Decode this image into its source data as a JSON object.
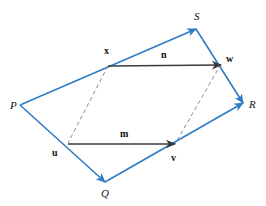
{
  "figure": {
    "width": 266,
    "height": 206,
    "background": "#ffffff",
    "colors": {
      "quadrilateral": "#2E7CC4",
      "vector_arrow": "#3A3A3A",
      "dashed_line": "#8C8C8C",
      "label_text": "#111111"
    },
    "stroke_widths": {
      "quadrilateral": 1.6,
      "vector_arrow": 1.6,
      "dashed_line": 1.0
    }
  },
  "vertices": [
    {
      "id": "P",
      "label": "P",
      "x": 20,
      "y": 105,
      "label_x": 10,
      "label_y": 100
    },
    {
      "id": "Q",
      "label": "Q",
      "x": 105,
      "y": 182,
      "label_x": 101,
      "label_y": 188
    },
    {
      "id": "R",
      "label": "R",
      "x": 243,
      "y": 103,
      "label_x": 249,
      "label_y": 99
    },
    {
      "id": "S",
      "label": "S",
      "x": 196,
      "y": 29,
      "label_x": 194,
      "label_y": 11
    }
  ],
  "points": [
    {
      "id": "u",
      "label": "u",
      "x": 68,
      "y": 143,
      "label_x": 52,
      "label_y": 148
    },
    {
      "id": "v",
      "label": "v",
      "x": 175,
      "y": 144,
      "label_x": 171,
      "label_y": 153
    },
    {
      "id": "x",
      "label": "x",
      "x": 108,
      "y": 66,
      "label_x": 104,
      "label_y": 46
    },
    {
      "id": "w",
      "label": "w",
      "x": 221,
      "y": 64,
      "label_x": 226,
      "label_y": 54
    }
  ],
  "edges": [
    {
      "id": "P-to-S",
      "from": "P",
      "to": "S",
      "arrow": "end",
      "style": "solid",
      "color": "#2E7CC4"
    },
    {
      "id": "P-to-Q",
      "from": "P",
      "to": "Q",
      "arrow": "end",
      "style": "solid",
      "color": "#2E7CC4"
    },
    {
      "id": "Q-to-R",
      "from": "Q",
      "to": "R",
      "arrow": "end",
      "style": "solid",
      "color": "#2E7CC4"
    },
    {
      "id": "S-to-R",
      "from": "S",
      "to": "R",
      "arrow": "end",
      "style": "solid",
      "color": "#2E7CC4"
    }
  ],
  "vectors": [
    {
      "id": "m",
      "label": "m",
      "from_point": "u",
      "to_point": "v",
      "x1": 68,
      "y1": 144,
      "x2": 175,
      "y2": 144,
      "label_x": 120,
      "label_y": 129,
      "color": "#3A3A3A"
    },
    {
      "id": "n",
      "label": "n",
      "from_point": "x",
      "to_point": "w",
      "x1": 108,
      "y1": 66,
      "x2": 221,
      "y2": 65,
      "label_x": 161,
      "label_y": 50,
      "color": "#3A3A3A"
    }
  ],
  "dashed_lines": [
    {
      "id": "x-to-u",
      "x1": 108,
      "y1": 66,
      "x2": 68,
      "y2": 143,
      "color": "#8C8C8C"
    },
    {
      "id": "w-to-v",
      "x1": 221,
      "y1": 64,
      "x2": 175,
      "y2": 144,
      "color": "#8C8C8C"
    }
  ]
}
